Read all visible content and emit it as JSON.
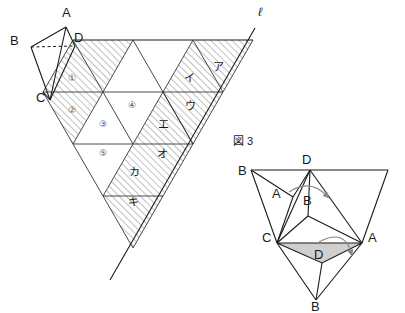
{
  "figure_left": {
    "name": "triangular-grid-net",
    "vertex_labels": [
      {
        "id": "A",
        "text": "A",
        "x": 62,
        "y": 17
      },
      {
        "id": "B",
        "text": "B",
        "x": 10,
        "y": 45
      },
      {
        "id": "C",
        "text": "C",
        "x": 36,
        "y": 102
      },
      {
        "id": "D",
        "text": "D",
        "x": 74,
        "y": 42
      }
    ],
    "line_label": {
      "text": "ℓ",
      "x": 258,
      "y": 16
    },
    "numbered_cells": [
      {
        "text": "①",
        "x": 73,
        "y": 78
      },
      {
        "text": "②",
        "x": 73,
        "y": 110
      },
      {
        "text": "③",
        "x": 104,
        "y": 124
      },
      {
        "text": "④",
        "x": 133,
        "y": 105
      },
      {
        "text": "⑤",
        "x": 104,
        "y": 153
      }
    ],
    "kana_cells": [
      {
        "text": "ア",
        "x": 218,
        "y": 67
      },
      {
        "text": "イ",
        "x": 189,
        "y": 78
      },
      {
        "text": "ウ",
        "x": 190,
        "y": 106
      },
      {
        "text": "エ",
        "x": 163,
        "y": 124
      },
      {
        "text": "オ",
        "x": 162,
        "y": 154
      },
      {
        "text": "カ",
        "x": 134,
        "y": 172
      },
      {
        "text": "キ",
        "x": 133,
        "y": 202
      }
    ]
  },
  "figure_right": {
    "caption": "図 3",
    "caption_x": 233,
    "caption_y": 145,
    "vertex_labels": [
      {
        "id": "B-left",
        "text": "B",
        "x": 238,
        "y": 175
      },
      {
        "id": "D-top",
        "text": "D",
        "x": 302,
        "y": 164
      },
      {
        "id": "A-inner-left",
        "text": "A",
        "x": 272,
        "y": 198
      },
      {
        "id": "B-inner",
        "text": "B",
        "x": 303,
        "y": 205
      },
      {
        "id": "C",
        "text": "C",
        "x": 268,
        "y": 238
      },
      {
        "id": "A-right",
        "text": "A",
        "x": 372,
        "y": 238
      },
      {
        "id": "D-inner-bottom",
        "text": "D",
        "x": 318,
        "y": 238
      },
      {
        "id": "B-bottom",
        "text": "B",
        "x": 317,
        "y": 308
      }
    ]
  },
  "colors": {
    "ink": "#1a1a1a",
    "grid": "#4a4a4a",
    "hatch": "#6b6b6b",
    "shaded_face": "#cfcfcf",
    "arrow": "#8a8a7a",
    "background": "#ffffff"
  }
}
